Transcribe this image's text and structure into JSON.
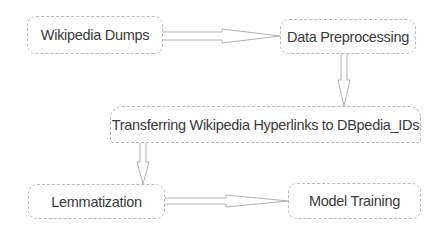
{
  "diagram": {
    "type": "flowchart",
    "nodes": [
      {
        "id": "n1",
        "label": "Wikipedia Dumps"
      },
      {
        "id": "n2",
        "label": "Data Preprocessing"
      },
      {
        "id": "n3",
        "label": "Transferring Wikipedia Hyperlinks to DBpedia_IDs"
      },
      {
        "id": "n4",
        "label": "Lemmatization"
      },
      {
        "id": "n5",
        "label": "Model Training"
      }
    ],
    "edges": [
      {
        "from": "n1",
        "to": "n2",
        "direction": "right"
      },
      {
        "from": "n2",
        "to": "n3",
        "direction": "down"
      },
      {
        "from": "n3",
        "to": "n4",
        "direction": "down"
      },
      {
        "from": "n4",
        "to": "n5",
        "direction": "right"
      }
    ],
    "colors": {
      "border": "#b8b8b8",
      "text": "#3a3a3a",
      "arrow": "#a8a8a8",
      "background": "#ffffff"
    }
  }
}
